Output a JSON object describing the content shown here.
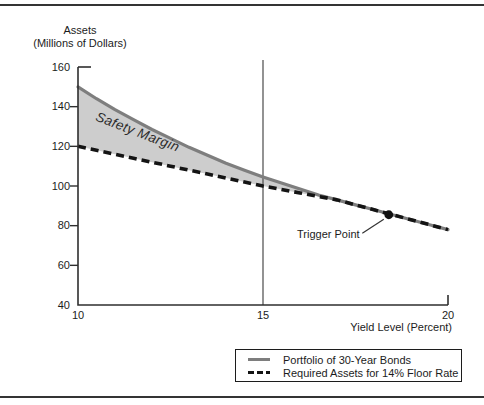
{
  "figure": {
    "y_axis_title_line1": "Assets",
    "y_axis_title_line2": "(Millions of Dollars)"
  },
  "chart_data": {
    "type": "line",
    "title": "",
    "xlabel": "Yield Level (Percent)",
    "ylabel": "Assets (Millions of Dollars)",
    "xlim": [
      10,
      20
    ],
    "ylim": [
      40,
      160
    ],
    "xticks": [
      10,
      15,
      20
    ],
    "yticks": [
      160,
      140,
      120,
      100,
      80,
      60,
      40
    ],
    "grid": false,
    "x": [
      10,
      10.5,
      11,
      11.5,
      12,
      12.5,
      13,
      13.5,
      14,
      14.5,
      15,
      15.5,
      16,
      16.5,
      17,
      17.5,
      18,
      18.5,
      19,
      19.5,
      20
    ],
    "series": [
      {
        "name": "Portfolio of 30-Year Bonds",
        "style": "solid",
        "color": "#7e7e7e",
        "values": [
          150,
          144,
          138.5,
          133.5,
          128.5,
          124,
          119.5,
          115.5,
          111.5,
          108,
          104.5,
          101.5,
          98.5,
          95.5,
          93,
          90.5,
          88,
          85.5,
          83,
          80.5,
          78
        ]
      },
      {
        "name": "Required Assets for 14% Floor Rate",
        "style": "dashed",
        "color": "#141414",
        "values": [
          120,
          118,
          116,
          114,
          112,
          110,
          108,
          106,
          104,
          102,
          100,
          98.25,
          96.5,
          94.75,
          93,
          90.5,
          88,
          85.5,
          83,
          80.5,
          78
        ]
      }
    ],
    "shaded_region": {
      "label": "Safety Margin",
      "between": [
        "Portfolio of 30-Year Bonds",
        "Required Assets for 14% Floor Rate"
      ],
      "x_range": [
        10,
        17
      ],
      "fill": "#cdcdcd"
    },
    "vertical_line_x": 15,
    "trigger_point": {
      "x": 18.4,
      "y": 85.5,
      "label": "Trigger Point"
    },
    "legend": {
      "position": "bottom",
      "entries": [
        "Portfolio of 30-Year Bonds",
        "Required Assets for 14% Floor Rate"
      ]
    },
    "colors": {
      "axis": "#2f2f2f",
      "vertical_line": "#4a4a4a",
      "trigger_dot": "#111111",
      "region_fill": "#cdcdcd"
    }
  }
}
